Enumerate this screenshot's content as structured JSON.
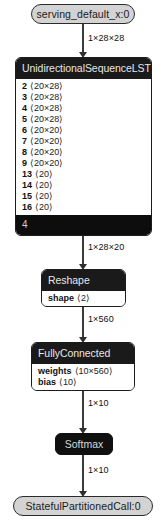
{
  "graph": {
    "title": "model graph",
    "nodes": {
      "input": {
        "label": "serving_default_x:0",
        "kind": "io"
      },
      "lstm": {
        "header": "UnidirectionalSequenceLSTM",
        "footer": "4",
        "attributes": [
          {
            "key": "2",
            "value": "⟨20×28⟩"
          },
          {
            "key": "3",
            "value": "⟨20×28⟩"
          },
          {
            "key": "4",
            "value": "⟨20×28⟩"
          },
          {
            "key": "5",
            "value": "⟨20×28⟩"
          },
          {
            "key": "6",
            "value": "⟨20×20⟩"
          },
          {
            "key": "7",
            "value": "⟨20×20⟩"
          },
          {
            "key": "8",
            "value": "⟨20×20⟩"
          },
          {
            "key": "9",
            "value": "⟨20×20⟩"
          },
          {
            "key": "13",
            "value": "⟨20⟩"
          },
          {
            "key": "14",
            "value": "⟨20⟩"
          },
          {
            "key": "15",
            "value": "⟨20⟩"
          },
          {
            "key": "16",
            "value": "⟨20⟩"
          }
        ]
      },
      "reshape": {
        "header": "Reshape",
        "attributes": [
          {
            "key": "shape",
            "value": "⟨2⟩"
          }
        ]
      },
      "fullyconnected": {
        "header": "FullyConnected",
        "attributes": [
          {
            "key": "weights",
            "value": "⟨10×560⟩"
          },
          {
            "key": "bias",
            "value": "⟨10⟩"
          }
        ]
      },
      "softmax": {
        "label": "Softmax",
        "kind": "solid"
      },
      "output": {
        "label": "StatefulPartitionedCall:0",
        "kind": "io"
      }
    },
    "edges": [
      {
        "id": "input-to-lstm",
        "label": "1×28×28"
      },
      {
        "id": "lstm-to-reshape",
        "label": "1×28×20"
      },
      {
        "id": "reshape-to-fc",
        "label": "1×560"
      },
      {
        "id": "fc-to-softmax",
        "label": "1×10"
      },
      {
        "id": "softmax-to-output",
        "label": "1×10"
      }
    ]
  },
  "colors": {
    "io_fill": "#d3d3d3",
    "header_fill": "#1a1a1a",
    "solid_fill": "#101010",
    "edge": "#3c3c3c",
    "background": "#ffffff"
  }
}
